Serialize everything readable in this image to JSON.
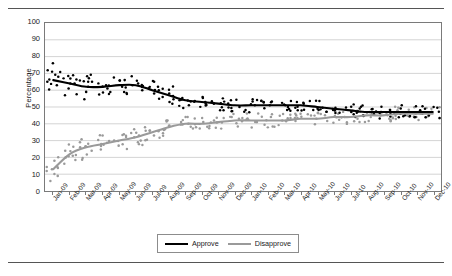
{
  "chart_data": {
    "type": "scatter",
    "title": "",
    "subtitle": "",
    "xlabel": "",
    "ylabel": "Percentage",
    "ylim": [
      0,
      100
    ],
    "ytick_step": 10,
    "yticks": [
      0,
      10,
      20,
      30,
      40,
      50,
      60,
      70,
      80,
      90,
      100
    ],
    "grid": "horizontal",
    "legend_position": "bottom-center",
    "x": [
      "Jan-09",
      "Feb-09",
      "Mar-09",
      "Apr-09",
      "May-09",
      "Jun-09",
      "Jul-09",
      "Aug-09",
      "Sep-09",
      "Oct-09",
      "Nov-09",
      "Dec-09",
      "Jan-10",
      "Feb-10",
      "Mar-10",
      "Apr-10",
      "May-10",
      "Jun-10",
      "Jul-10",
      "Aug-10",
      "Sep-10",
      "Oct-10",
      "Nov-10",
      "Dec-10"
    ],
    "series": [
      {
        "name": "Approve",
        "color": "#000000",
        "marker": "dot",
        "trend": "smoothed-line",
        "values": [
          66,
          64,
          62,
          62,
          63,
          63,
          60,
          57,
          54,
          53,
          52,
          51,
          51,
          51,
          51,
          51,
          50,
          49,
          48,
          47,
          47,
          47,
          47,
          47
        ],
        "points": [
          {
            "x": "Jan-09",
            "y": 68
          },
          {
            "x": "Jan-09",
            "y": 76
          },
          {
            "x": "Jan-09",
            "y": 65
          },
          {
            "x": "Jan-09",
            "y": 63
          },
          {
            "x": "Feb-09",
            "y": 67
          },
          {
            "x": "Feb-09",
            "y": 64
          },
          {
            "x": "Feb-09",
            "y": 61
          },
          {
            "x": "Mar-09",
            "y": 62
          },
          {
            "x": "Mar-09",
            "y": 59
          },
          {
            "x": "Mar-09",
            "y": 65
          },
          {
            "x": "Apr-09",
            "y": 63
          },
          {
            "x": "Apr-09",
            "y": 61
          },
          {
            "x": "May-09",
            "y": 66
          },
          {
            "x": "May-09",
            "y": 62
          },
          {
            "x": "Jun-09",
            "y": 64
          },
          {
            "x": "Jun-09",
            "y": 60
          },
          {
            "x": "Jul-09",
            "y": 58
          },
          {
            "x": "Jul-09",
            "y": 62
          },
          {
            "x": "Aug-09",
            "y": 56
          },
          {
            "x": "Aug-09",
            "y": 53
          },
          {
            "x": "Sep-09",
            "y": 54
          },
          {
            "x": "Sep-09",
            "y": 51
          },
          {
            "x": "Oct-09",
            "y": 53
          },
          {
            "x": "Oct-09",
            "y": 56
          },
          {
            "x": "Nov-09",
            "y": 52
          },
          {
            "x": "Dec-09",
            "y": 50
          },
          {
            "x": "Jan-10",
            "y": 51
          },
          {
            "x": "Feb-10",
            "y": 53
          },
          {
            "x": "Mar-10",
            "y": 50
          },
          {
            "x": "Apr-10",
            "y": 52
          },
          {
            "x": "May-10",
            "y": 49
          },
          {
            "x": "Jun-10",
            "y": 48
          },
          {
            "x": "Jul-10",
            "y": 47
          },
          {
            "x": "Aug-10",
            "y": 45
          },
          {
            "x": "Sep-10",
            "y": 47
          },
          {
            "x": "Oct-10",
            "y": 46
          },
          {
            "x": "Nov-10",
            "y": 48
          },
          {
            "x": "Dec-10",
            "y": 47
          }
        ],
        "start_value": 66,
        "end_value": 47
      },
      {
        "name": "Disapprove",
        "color": "#9a9a9a",
        "marker": "dot",
        "trend": "smoothed-line",
        "values": [
          13,
          22,
          26,
          28,
          30,
          32,
          35,
          38,
          40,
          40,
          41,
          42,
          42,
          42,
          42,
          43,
          43,
          44,
          44,
          45,
          45,
          46,
          46,
          46
        ],
        "points": [
          {
            "x": "Jan-09",
            "y": 9
          },
          {
            "x": "Jan-09",
            "y": 13
          },
          {
            "x": "Jan-09",
            "y": 18
          },
          {
            "x": "Feb-09",
            "y": 21
          },
          {
            "x": "Feb-09",
            "y": 24
          },
          {
            "x": "Feb-09",
            "y": 20
          },
          {
            "x": "Mar-09",
            "y": 26
          },
          {
            "x": "Mar-09",
            "y": 29
          },
          {
            "x": "Mar-09",
            "y": 24
          },
          {
            "x": "Apr-09",
            "y": 28
          },
          {
            "x": "Apr-09",
            "y": 33
          },
          {
            "x": "May-09",
            "y": 30
          },
          {
            "x": "May-09",
            "y": 27
          },
          {
            "x": "Jun-09",
            "y": 33
          },
          {
            "x": "Jun-09",
            "y": 30
          },
          {
            "x": "Jul-09",
            "y": 36
          },
          {
            "x": "Jul-09",
            "y": 33
          },
          {
            "x": "Aug-09",
            "y": 39
          },
          {
            "x": "Aug-09",
            "y": 42
          },
          {
            "x": "Sep-09",
            "y": 40
          },
          {
            "x": "Sep-09",
            "y": 44
          },
          {
            "x": "Oct-09",
            "y": 41
          },
          {
            "x": "Oct-09",
            "y": 38
          },
          {
            "x": "Nov-09",
            "y": 42
          },
          {
            "x": "Dec-09",
            "y": 43
          },
          {
            "x": "Jan-10",
            "y": 41
          },
          {
            "x": "Feb-10",
            "y": 44
          },
          {
            "x": "Mar-10",
            "y": 42
          },
          {
            "x": "Apr-10",
            "y": 45
          },
          {
            "x": "May-10",
            "y": 43
          },
          {
            "x": "Jun-10",
            "y": 46
          },
          {
            "x": "Jul-10",
            "y": 44
          },
          {
            "x": "Aug-10",
            "y": 47
          },
          {
            "x": "Sep-10",
            "y": 45
          },
          {
            "x": "Oct-10",
            "y": 48
          },
          {
            "x": "Nov-10",
            "y": 46
          },
          {
            "x": "Dec-10",
            "y": 46
          }
        ],
        "start_value": 13,
        "end_value": 46
      }
    ]
  },
  "legend": {
    "approve_label": "Approve",
    "disapprove_label": "Disapprove"
  }
}
